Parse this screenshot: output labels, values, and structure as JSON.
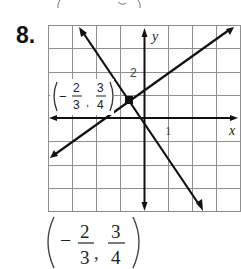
{
  "problem": {
    "number": "8.",
    "previous_fragment": "( − 3 )"
  },
  "graph": {
    "axis_labels": {
      "x": "x",
      "y": "y"
    },
    "tick_labels": {
      "x_one": "1",
      "y_two": "2"
    },
    "grid": {
      "x_range": [
        -4,
        4
      ],
      "y_range": [
        -4,
        4
      ],
      "step": 1
    },
    "point_label": {
      "sign": "−",
      "x_num": "2",
      "x_den": "3",
      "y_num": "3",
      "y_den": "4"
    },
    "lines": [
      {
        "name": "decreasing-line",
        "slope": "negative"
      },
      {
        "name": "increasing-line",
        "slope": "positive"
      }
    ],
    "intersection": {
      "x": "-2/3",
      "y": "3/4"
    }
  },
  "answer": {
    "sign": "−",
    "x_num": "2",
    "x_den": "3",
    "y_num": "3",
    "y_den": "4",
    "separator": ","
  },
  "colors": {
    "line": "#111111",
    "grid": "#8a8a8a",
    "text": "#222222"
  }
}
